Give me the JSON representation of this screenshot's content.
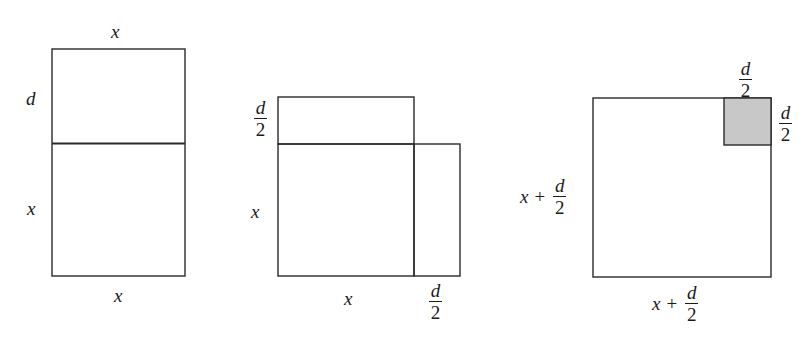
{
  "figures": [
    {
      "id": "figure-1",
      "labels": {
        "top": "x",
        "left_upper": "d",
        "left_lower": "x",
        "bottom": "x"
      }
    },
    {
      "id": "figure-2",
      "labels": {
        "left_upper": {
          "numerator": "d",
          "denominator": "2"
        },
        "left_lower": "x",
        "bottom_left": "x",
        "bottom_right": {
          "numerator": "d",
          "denominator": "2"
        }
      }
    },
    {
      "id": "figure-3",
      "labels": {
        "top_corner": {
          "numerator": "d",
          "denominator": "2"
        },
        "right_corner": {
          "numerator": "d",
          "denominator": "2"
        },
        "left": {
          "var": "x",
          "op": "+",
          "numerator": "d",
          "denominator": "2"
        },
        "bottom": {
          "var": "x",
          "op": "+",
          "numerator": "d",
          "denominator": "2"
        }
      },
      "shaded_color": "#c8c8c8"
    }
  ],
  "colors": {
    "stroke": "#2a2a2a",
    "shade": "#c8c8c8",
    "background": "#ffffff"
  }
}
